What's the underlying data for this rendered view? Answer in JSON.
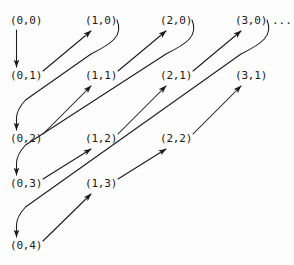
{
  "figure": {
    "background_color": "#fdfdfd",
    "stroke_color": "#1a1a1a",
    "width": 294,
    "height": 265
  },
  "chart_data": {
    "type": "diagram",
    "xlabel": "",
    "ylabel": "",
    "grid": false,
    "legend": null,
    "columns_x": [
      10,
      85,
      160,
      235
    ],
    "rows_y": [
      15,
      70,
      133,
      178,
      240
    ],
    "nodes": [
      {
        "label": "(0,0)",
        "col": 0,
        "row": 0,
        "x": 10,
        "y": 15
      },
      {
        "label": "(1,0)",
        "col": 1,
        "row": 0,
        "x": 85,
        "y": 15
      },
      {
        "label": "(2,0)",
        "col": 2,
        "row": 0,
        "x": 160,
        "y": 15
      },
      {
        "label": "(3,0)",
        "col": 3,
        "row": 0,
        "x": 235,
        "y": 15
      },
      {
        "label": "(0,1)",
        "col": 0,
        "row": 1,
        "x": 10,
        "y": 70
      },
      {
        "label": "(1,1)",
        "col": 1,
        "row": 1,
        "x": 85,
        "y": 70
      },
      {
        "label": "(2,1)",
        "col": 2,
        "row": 1,
        "x": 160,
        "y": 70
      },
      {
        "label": "(3,1)",
        "col": 3,
        "row": 1,
        "x": 235,
        "y": 70
      },
      {
        "label": "(0,2)",
        "col": 0,
        "row": 2,
        "x": 10,
        "y": 133
      },
      {
        "label": "(1,2)",
        "col": 1,
        "row": 2,
        "x": 85,
        "y": 133
      },
      {
        "label": "(2,2)",
        "col": 2,
        "row": 2,
        "x": 160,
        "y": 133
      },
      {
        "label": "(0,3)",
        "col": 0,
        "row": 3,
        "x": 10,
        "y": 178
      },
      {
        "label": "(1,3)",
        "col": 1,
        "row": 3,
        "x": 85,
        "y": 178
      },
      {
        "label": "(0,4)",
        "col": 0,
        "row": 4,
        "x": 10,
        "y": 240
      }
    ],
    "ellipsis": {
      "label": "...",
      "x": 272,
      "y": 15
    },
    "traversal_order": [
      "(0,0)",
      "(0,1)",
      "(1,0)",
      "(0,2)",
      "(1,1)",
      "(2,0)",
      "(0,3)",
      "(1,2)",
      "(2,1)",
      "(3,0)",
      "(0,4)",
      "(1,3)",
      "(2,2)",
      "(3,1)"
    ],
    "arrows": [
      {
        "kind": "vertical",
        "from": "(0,0)",
        "to": "(0,1)"
      },
      {
        "kind": "diagonal",
        "from": "(0,1)",
        "to": "(1,0)"
      },
      {
        "kind": "return",
        "from": "(1,0)",
        "to": "(0,2)"
      },
      {
        "kind": "diagonal",
        "from": "(0,2)",
        "to": "(1,1)"
      },
      {
        "kind": "diagonal",
        "from": "(1,1)",
        "to": "(2,0)"
      },
      {
        "kind": "return",
        "from": "(2,0)",
        "to": "(0,3)"
      },
      {
        "kind": "diagonal",
        "from": "(0,3)",
        "to": "(1,2)"
      },
      {
        "kind": "diagonal",
        "from": "(1,2)",
        "to": "(2,1)"
      },
      {
        "kind": "diagonal",
        "from": "(2,1)",
        "to": "(3,0)"
      },
      {
        "kind": "return",
        "from": "(3,0)",
        "to": "(0,4)"
      },
      {
        "kind": "diagonal",
        "from": "(0,4)",
        "to": "(1,3)"
      },
      {
        "kind": "diagonal",
        "from": "(1,3)",
        "to": "(2,2)"
      },
      {
        "kind": "diagonal",
        "from": "(2,2)",
        "to": "(3,1)"
      }
    ]
  }
}
